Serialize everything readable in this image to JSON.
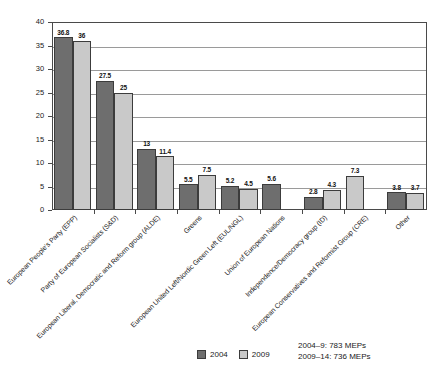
{
  "chart_data": {
    "type": "bar",
    "title": "",
    "xlabel": "",
    "ylabel": "",
    "ylim": [
      0,
      40
    ],
    "yticks": [
      0,
      5,
      10,
      15,
      20,
      25,
      30,
      35,
      40
    ],
    "grid": true,
    "legend_position": "bottom-center",
    "categories": [
      "European People's Party (EPP)",
      "Party of European Socialists (S&D)",
      "European Liberal, Democratic and Reform group (ALDE)",
      "Greens",
      "European United Left/Nordic Green Left (EUL/NGL)",
      "Union of European Nations",
      "Independence/Democracy group (ID)",
      "European Conservatives and Reformist Group (CRE)",
      "Other"
    ],
    "series": [
      {
        "name": "2004",
        "color": "#6e6e6e",
        "values": [
          36.8,
          27.5,
          13,
          5.5,
          5.2,
          5.6,
          2.8,
          null,
          3.8
        ],
        "labels": [
          "36.8",
          "27.5",
          "13",
          "5.5",
          "5.2",
          "5.6",
          "2.8",
          "",
          "3.8"
        ]
      },
      {
        "name": "2009",
        "color": "#c9c9c9",
        "values": [
          36,
          25,
          11.4,
          7.5,
          4.5,
          null,
          4.3,
          7.3,
          3.7
        ],
        "labels": [
          "36",
          "25",
          "11.4",
          "7.5",
          "4.5",
          "",
          "4.3",
          "7.3",
          "3.7"
        ]
      }
    ]
  },
  "legend": {
    "items": [
      {
        "label": "2004",
        "color": "#6e6e6e"
      },
      {
        "label": "2009",
        "color": "#c9c9c9"
      }
    ]
  },
  "footnotes": [
    "2004–9: 783 MEPs",
    "2009–14: 736 MEPs"
  ]
}
